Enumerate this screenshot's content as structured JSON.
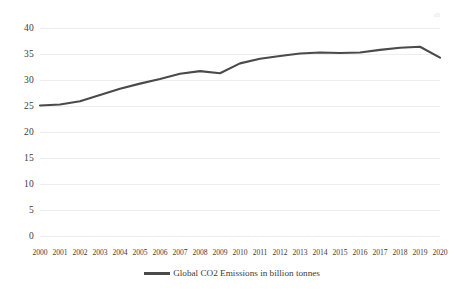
{
  "chart_data": {
    "type": "line",
    "title": "",
    "subtitle": "",
    "xlabel": "",
    "ylabel": "",
    "x": [
      "2000",
      "2001",
      "2002",
      "2003",
      "2004",
      "2005",
      "2006",
      "2007",
      "2008",
      "2009",
      "2010",
      "2011",
      "2012",
      "2013",
      "2014",
      "2015",
      "2016",
      "2017",
      "2018",
      "2019",
      "2020"
    ],
    "categories": [
      "2000",
      "2001",
      "2002",
      "2003",
      "2004",
      "2005",
      "2006",
      "2007",
      "2008",
      "2009",
      "2010",
      "2011",
      "2012",
      "2013",
      "2014",
      "2015",
      "2016",
      "2017",
      "2018",
      "2019",
      "2020"
    ],
    "series": [
      {
        "name": "Global CO2 Emissions in billion tonnes",
        "color": "#4a4a4a",
        "values": [
          25.1,
          25.3,
          25.9,
          27.1,
          28.3,
          29.3,
          30.2,
          31.2,
          31.7,
          31.3,
          33.2,
          34.1,
          34.6,
          35.1,
          35.3,
          35.2,
          35.3,
          35.8,
          36.2,
          36.4,
          34.3
        ]
      }
    ],
    "ylim": [
      0,
      40
    ],
    "ytick_step": 5,
    "y_ticks": [
      "40",
      "35",
      "30",
      "25",
      "20",
      "15",
      "10",
      "5",
      "0"
    ],
    "grid": true,
    "grid_axis": "y",
    "legend_position": "bottom",
    "legend": [
      "Global CO2 Emissions in billion tonnes"
    ],
    "annotations": []
  },
  "legend": {
    "entries": [
      {
        "label": "Global CO2 Emissions in billion tonnes",
        "swatch_name": "legend-line-swatch"
      }
    ]
  },
  "artifact": {
    "mark": "ıll"
  },
  "colors": {
    "series_line": "#4a4a4a",
    "gridline": "#ededed",
    "text": "#3c3c3c",
    "background": "#ffffff"
  }
}
